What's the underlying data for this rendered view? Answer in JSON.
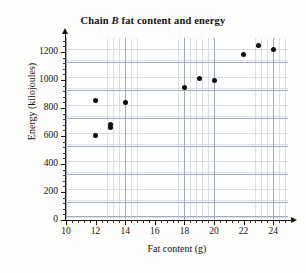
{
  "chart_data": {
    "type": "scatter",
    "title": "Chain B fat content and energy",
    "title_prefix": "Chain ",
    "title_italic": "B",
    "title_suffix": " fat content and energy",
    "xlabel": "Fat content (g)",
    "ylabel": "Energy (kilojoules)",
    "xlim": [
      10,
      25
    ],
    "ylim": [
      0,
      1300
    ],
    "xticks": [
      10,
      12,
      14,
      16,
      18,
      20,
      22,
      24
    ],
    "yticks": [
      0,
      200,
      400,
      600,
      800,
      1000,
      1200
    ],
    "xtick_labels": [
      "10",
      "12",
      "14",
      "16",
      "18",
      "20",
      "22",
      "24"
    ],
    "ytick_labels": [
      "0",
      "200",
      "400",
      "600",
      "800",
      "1000",
      "1200"
    ],
    "x_minor_step": 0.4,
    "y_minor_step": 40,
    "grid": true,
    "legend": false,
    "marker": "filled-circle",
    "marker_color": "#100d0a",
    "grid_minor_color": "#cdd4e0",
    "grid_major_color": "#9aa4b5",
    "axis_color": "#15100c",
    "x": [
      12,
      12,
      13,
      13,
      14,
      18,
      19,
      20,
      22,
      23,
      24
    ],
    "y": [
      855,
      605,
      680,
      660,
      840,
      950,
      1010,
      1000,
      1180,
      1250,
      1215
    ],
    "points": [
      {
        "x": 12,
        "y": 855
      },
      {
        "x": 12,
        "y": 605
      },
      {
        "x": 13,
        "y": 680
      },
      {
        "x": 13,
        "y": 660
      },
      {
        "x": 14,
        "y": 840
      },
      {
        "x": 18,
        "y": 950
      },
      {
        "x": 19,
        "y": 1010
      },
      {
        "x": 20,
        "y": 1000
      },
      {
        "x": 22,
        "y": 1180
      },
      {
        "x": 23,
        "y": 1250
      },
      {
        "x": 24,
        "y": 1215
      }
    ]
  }
}
